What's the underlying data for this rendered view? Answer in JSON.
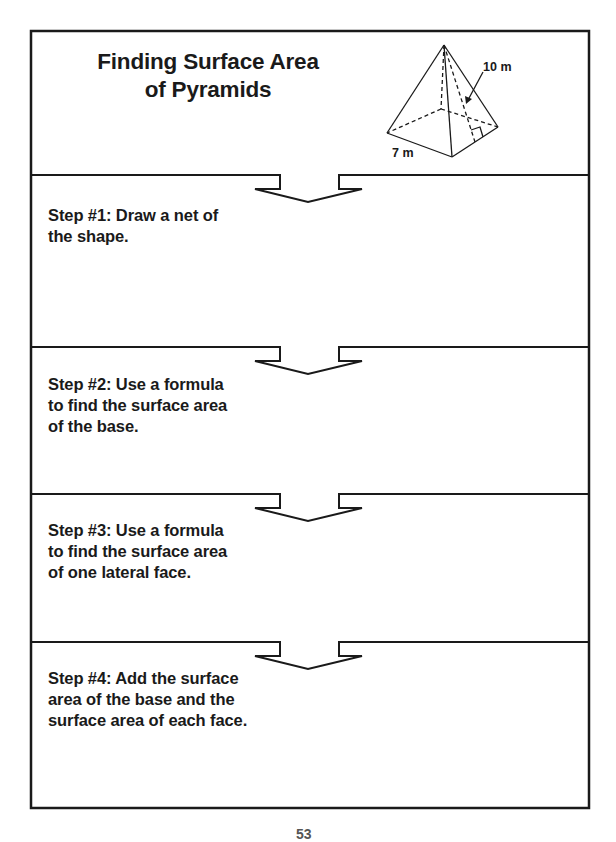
{
  "document": {
    "title_lines": [
      "Finding Surface Area",
      "of Pyramids"
    ],
    "figure": {
      "shape": "square pyramid",
      "slant_height_label": "10 m",
      "base_edge_label": "7 m"
    },
    "steps": [
      {
        "lines": [
          "Step #1: Draw a net of",
          "the shape."
        ]
      },
      {
        "lines": [
          "Step #2: Use a formula",
          "to find the surface area",
          "of the base."
        ]
      },
      {
        "lines": [
          "Step #3: Use a formula",
          "to find the surface area",
          "of one lateral face."
        ]
      },
      {
        "lines": [
          "Step #4: Add the surface",
          "area of the base and the",
          "surface area of each face."
        ]
      }
    ],
    "page_number": "53",
    "colors": {
      "ink": "#1a1a1a",
      "paper": "#ffffff"
    }
  }
}
